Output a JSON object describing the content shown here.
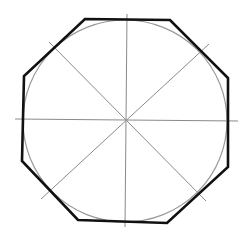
{
  "diagram": {
    "title": "",
    "shapes": {
      "circle": {
        "role": "inscribed-circle"
      },
      "octagon": {
        "role": "circumscribed-octagon",
        "sides": 8
      },
      "construction_lines": [
        {
          "id": "horizontal",
          "angle_deg": 0
        },
        {
          "id": "vertical",
          "angle_deg": 90
        },
        {
          "id": "diagonal-1",
          "angle_deg": 45
        },
        {
          "id": "diagonal-2",
          "angle_deg": 135
        }
      ]
    },
    "colors": {
      "octagon_stroke": "#111111",
      "circle_stroke": "#9a9a9a",
      "construction_stroke": "#8a8a8a",
      "background": "#ffffff"
    }
  }
}
